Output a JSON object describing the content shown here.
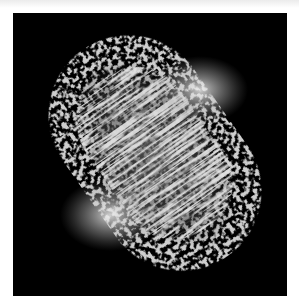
{
  "image": {
    "kind": "fluorescence micrograph",
    "subject": "dividing cell with mitotic spindle fibers",
    "alt_text": "Grayscale micrograph of a cell in division showing bright spindle poles and fibrous microtubule bundles on a black background",
    "colors": {
      "background": "#000000",
      "margin": "#ffffff",
      "halo_speckle": "#8a8a8a",
      "fiber": "#b8b8b8",
      "pole_highlight": "#f2f2f2"
    },
    "poles": [
      {
        "label": "upper pole",
        "x": 187,
        "y": 77
      },
      {
        "label": "lower pole",
        "x": 97,
        "y": 202
      }
    ],
    "orientation_deg": -35
  }
}
